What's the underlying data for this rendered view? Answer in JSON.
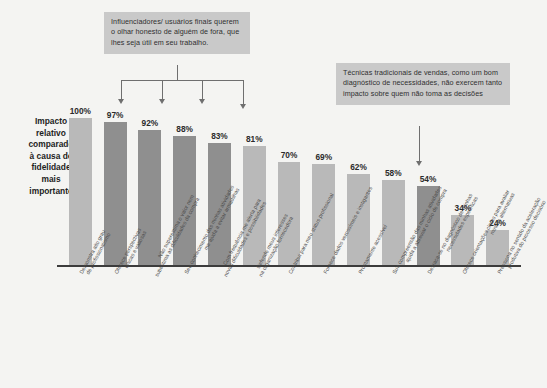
{
  "chart_data": {
    "type": "bar",
    "title": "",
    "subtitle": "",
    "xlabel": "",
    "ylabel": "Impacto relativo comparado à causa de fidelidade mais importante",
    "ylim": [
      0,
      100
    ],
    "grid": false,
    "legend": "none",
    "value_suffix": "%",
    "categories": [
      "Demonstra alto grau de profissionalismo",
      "Oferece perspectivas únicas e valiosas",
      "Não superestima o valor nem subestima as dificuldades da compra",
      "Seu conhecimento das minhas atividades me ajuda a evitar armadilhas",
      "Com frequência me alerta para novas dificuldades e possibilidades",
      "Defende meus interesses na organização fornecedora",
      "Contribui para meu status profissional",
      "Fornece dados verossímeis e instigantes",
      "Prontamente acessível",
      "Sua compreensão das minhas atividades ajuda a abreviar o ciclo de compra",
      "Destaca-se no diagnóstico de minhas necessidades específicas",
      "Oferece orientações claras para avaliar minhas alternativas",
      "Pressiona no sentido da aceleração produtiva do processo decisório"
    ],
    "category_lines": [
      [
        "Demonstra alto grau",
        "de profissionalismo"
      ],
      [
        "Oferece perspectivas",
        "únicas e valiosas"
      ],
      [
        "Não superestima o valor nem",
        "subestima as dificuldades da compra"
      ],
      [
        "Seu conhecimento das minhas atividades",
        "me ajuda a evitar armadilhas"
      ],
      [
        "Com frequência me alerta para",
        "novas dificuldades e possibilidades"
      ],
      [
        "Defende meus interesses",
        "na organização fornecedora"
      ],
      [
        "Contribui para meu status profissional"
      ],
      [
        "Fornece dados verossímeis e instigantes"
      ],
      [
        "Prontamente acessível"
      ],
      [
        "Sua compreensão das minhas atividades",
        "ajuda a abreviar o ciclo de compra"
      ],
      [
        "Destaca-se no diagnóstico de minhas",
        "necessidades específicas"
      ],
      [
        "Oferece orientações claras para avaliar",
        "minhas alternativas"
      ],
      [
        "Pressiona no sentido da aceleração",
        "produtiva do processo decisório"
      ]
    ],
    "values": [
      100,
      97,
      92,
      88,
      83,
      81,
      70,
      69,
      62,
      58,
      54,
      34,
      24
    ],
    "value_labels": [
      "100%",
      "97%",
      "92%",
      "88%",
      "83%",
      "81%",
      "70%",
      "69%",
      "62%",
      "58%",
      "54%",
      "34%",
      "24%"
    ],
    "highlighted_indices": [
      1,
      2,
      3,
      4,
      10
    ],
    "colors": {
      "bar_default": "#b9b9b9",
      "bar_highlight": "#8f8f8f",
      "axis": "#3c3c3c",
      "callout_bg": "#c9c9c9",
      "connector": "#6f6f6f",
      "background": "#f4f4f2",
      "text": "#3a3a3a"
    },
    "annotations": [
      {
        "id": "callout-influenciadores",
        "text": "Influenciadores/ usuários finais querem o olhar honesto de alguém de fora, que lhes seja útil em seu trabalho.",
        "lines": [
          "Influenciadores/ usuários finais",
          "querem o olhar honesto de",
          "alguém de fora, que lhes seja",
          "útil em seu trabalho."
        ],
        "points_to": [
          1,
          2,
          3,
          4
        ]
      },
      {
        "id": "callout-tecnicas",
        "text": "Técnicas tradicionais de vendas, como um bom diagnóstico de necessidades, não exercem tanto impacto sobre quem não toma as decisões",
        "lines": [
          "Técnicas tradicionais de vendas,",
          "como um bom diagnóstico de",
          "necessidades, não exercem tanto",
          "impacto sobre quem não toma as",
          "decisões"
        ],
        "points_to": [
          10
        ]
      }
    ]
  },
  "axis": {
    "y_label_lines": [
      "Impacto",
      "relativo",
      "comparado",
      "à causa de",
      "fidelidade",
      "mais",
      "importante"
    ]
  }
}
